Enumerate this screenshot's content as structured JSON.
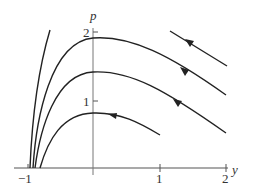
{
  "diagram": {
    "type": "phase-portrait",
    "axes": {
      "x_label": "y",
      "y_label": "p",
      "x_ticks": [
        {
          "value": -1,
          "label": "−1"
        },
        {
          "value": 1,
          "label": "1"
        },
        {
          "value": 2,
          "label": "2"
        }
      ],
      "y_ticks": [
        {
          "value": 1,
          "label": "1"
        },
        {
          "value": 2,
          "label": "2"
        }
      ]
    },
    "trajectories": [
      {
        "name": "top-segment",
        "peak_p": null,
        "arrow_direction": "left-up"
      },
      {
        "name": "curve-peak-2",
        "peak_p": 1.9,
        "arrow_direction": "left-up"
      },
      {
        "name": "curve-peak-1.4",
        "peak_p": 1.4,
        "arrow_direction": "left-up"
      },
      {
        "name": "curve-peak-0.8",
        "peak_p": 0.8,
        "arrow_direction": "left"
      },
      {
        "name": "steep-left-curve",
        "peak_p": null,
        "arrow_direction": null
      }
    ],
    "colors": {
      "curve": "#222222",
      "axis": "#555555",
      "text": "#333333"
    }
  }
}
